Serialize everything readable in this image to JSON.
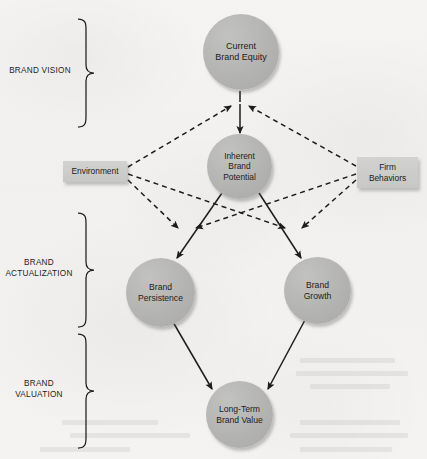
{
  "diagram": {
    "background_color": "#f3f2f0",
    "node_fill_color": "#b6b6b5",
    "box_fill_color": "#c8c8c7",
    "line_color": "#1d1d1d"
  },
  "stages": [
    {
      "id": "brand-vision",
      "lines": [
        "BRAND VISION"
      ]
    },
    {
      "id": "brand-actualization",
      "lines": [
        "BRAND",
        "ACTUALIZATION"
      ]
    },
    {
      "id": "brand-valuation",
      "lines": [
        "BRAND",
        "VALUATION"
      ]
    }
  ],
  "nodes": {
    "current_brand_equity": {
      "lines": [
        "Current",
        "Brand Equity"
      ],
      "shape": "circle"
    },
    "inherent_brand_potential": {
      "lines": [
        "Inherent",
        "Brand",
        "Potential"
      ],
      "shape": "circle"
    },
    "environment": {
      "lines": [
        "Environment"
      ],
      "shape": "box"
    },
    "firm_behaviors": {
      "lines": [
        "Firm",
        "Behaviors"
      ],
      "shape": "box"
    },
    "brand_persistence": {
      "lines": [
        "Brand",
        "Persistence"
      ],
      "shape": "circle"
    },
    "brand_growth": {
      "lines": [
        "Brand",
        "Growth"
      ],
      "shape": "circle"
    },
    "long_term_brand_value": {
      "lines": [
        "Long-Term",
        "Brand Value"
      ],
      "shape": "circle"
    }
  },
  "edges": [
    {
      "from": "current_brand_equity",
      "to": "inherent_brand_potential",
      "style": "solid"
    },
    {
      "from": "environment",
      "to": "inherent_brand_potential",
      "style": "dashed"
    },
    {
      "from": "firm_behaviors",
      "to": "inherent_brand_potential",
      "style": "dashed"
    },
    {
      "from": "environment",
      "to": "brand_persistence",
      "style": "dashed"
    },
    {
      "from": "environment",
      "to": "brand_growth",
      "style": "dashed"
    },
    {
      "from": "firm_behaviors",
      "to": "brand_persistence",
      "style": "dashed"
    },
    {
      "from": "firm_behaviors",
      "to": "brand_growth",
      "style": "dashed"
    },
    {
      "from": "inherent_brand_potential",
      "to": "brand_persistence",
      "style": "solid"
    },
    {
      "from": "inherent_brand_potential",
      "to": "brand_growth",
      "style": "solid"
    },
    {
      "from": "brand_persistence",
      "to": "long_term_brand_value",
      "style": "solid"
    },
    {
      "from": "brand_growth",
      "to": "long_term_brand_value",
      "style": "solid"
    }
  ]
}
